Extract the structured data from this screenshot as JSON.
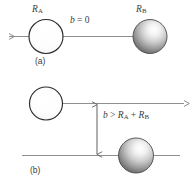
{
  "figure": {
    "caption_a": "(a)",
    "caption_b": "(b)",
    "panels": [
      {
        "id": "panel-a",
        "tag": "(a)",
        "impact_parameter_label": "b = 0",
        "impact_parameter_symbol": "b",
        "impact_parameter_operator": "=",
        "impact_parameter_value": "0",
        "sphere_a_label": "R",
        "sphere_a_subscript": "A",
        "sphere_b_label": "R",
        "sphere_b_subscript": "B",
        "trajectory_direction": "left",
        "description": "Head-on collision: impact parameter equals zero"
      },
      {
        "id": "panel-b",
        "tag": "(b)",
        "impact_parameter_symbol": "b",
        "impact_parameter_operator": ">",
        "impact_parameter_term_1": "R",
        "impact_parameter_term_1_sub": "A",
        "impact_parameter_plus": "+",
        "impact_parameter_term_2": "R",
        "impact_parameter_term_2_sub": "B",
        "impact_parameter_label": "b > R_A + R_B",
        "trajectory_direction": "right",
        "description": "Miss: impact parameter exceeds sum of radii"
      }
    ],
    "colors": {
      "line": "#8f8f8f",
      "outline": "#2b2b2b",
      "sphere_light": "#ffffff",
      "sphere_shade_dark": "#5d5d5d",
      "text": "#3d3d3d",
      "background": "#ffffff"
    }
  }
}
